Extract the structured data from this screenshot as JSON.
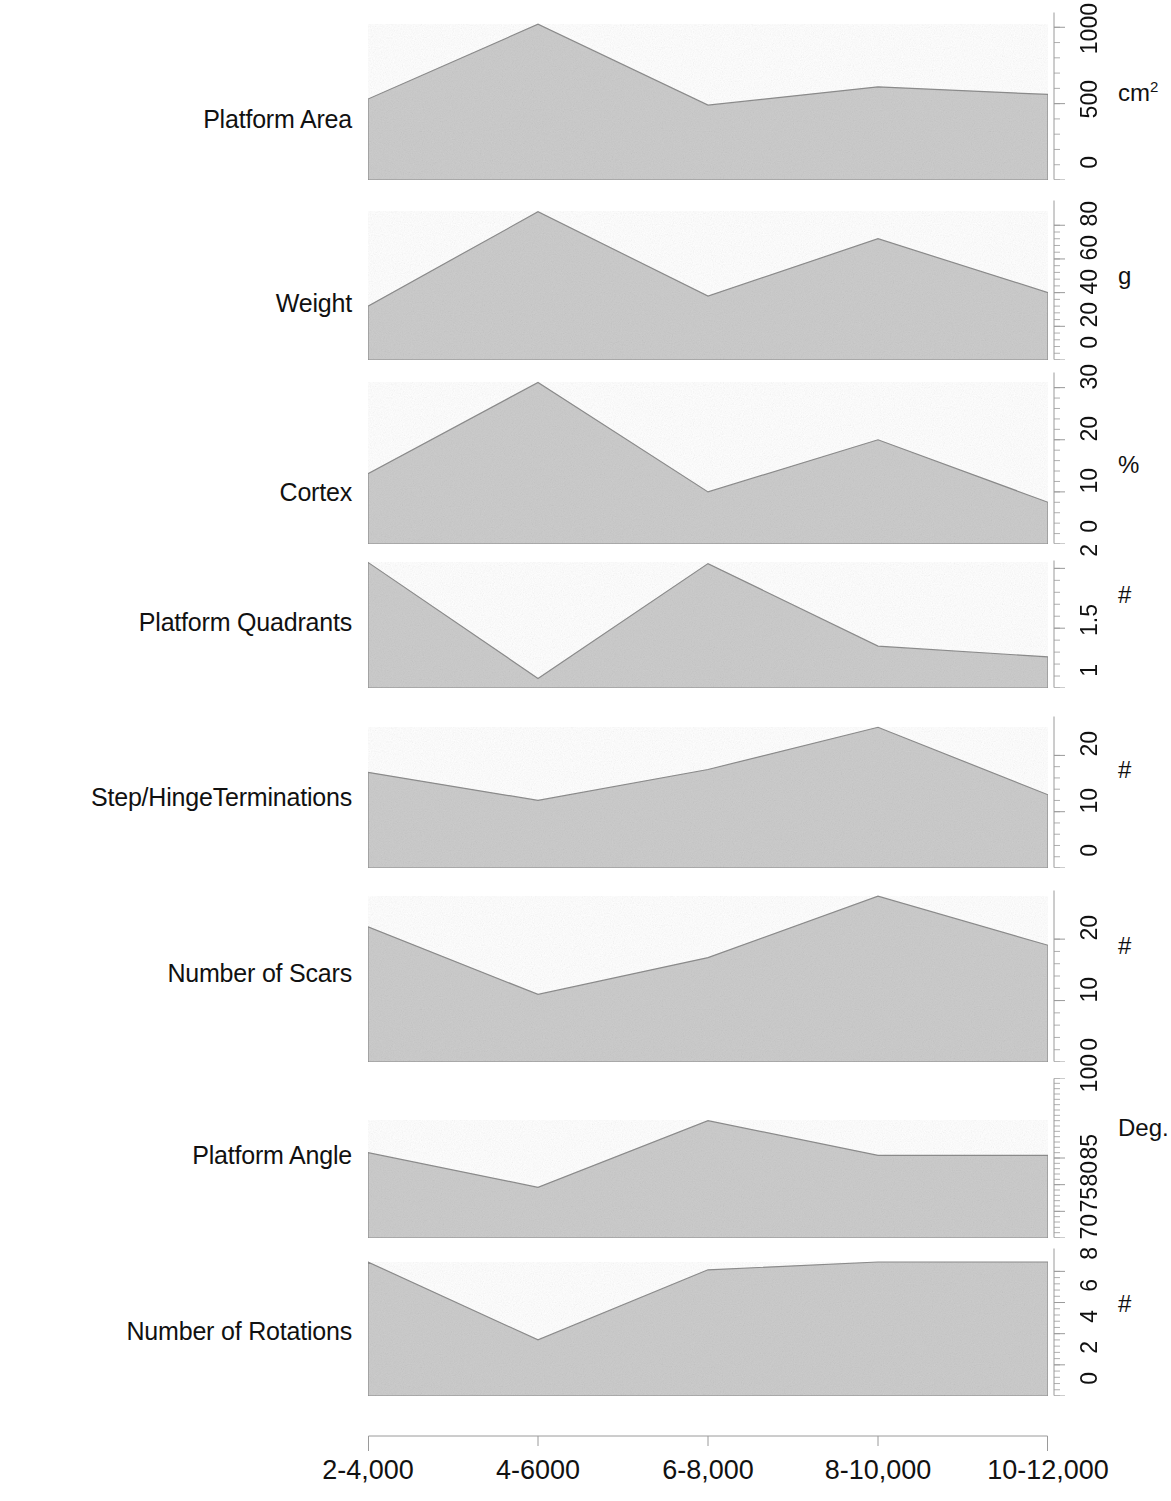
{
  "figure": {
    "background": "#ffffff",
    "series_fill": "#c9c9c9",
    "series_stroke": "#8a8a8a",
    "axis_color": "#9a9a9a",
    "text_color": "#111111"
  },
  "xaxis": {
    "categories": [
      "2-4,000",
      "4-6000",
      "6-8,000",
      "8-10,000",
      "10-12,000"
    ]
  },
  "panels": [
    {
      "label": "Platform Area",
      "unit": "cm",
      "unit_sup": "2",
      "ticks": [
        "0",
        "500",
        "1000"
      ],
      "tick_values": [
        0,
        500,
        1000
      ],
      "ylim": [
        0,
        1100
      ],
      "values": [
        530,
        1020,
        490,
        610,
        560
      ]
    },
    {
      "label": "Weight",
      "unit": "g",
      "unit_sup": "",
      "ticks": [
        "0",
        "20",
        "40",
        "60",
        "80"
      ],
      "tick_values": [
        0,
        20,
        40,
        60,
        80
      ],
      "ylim": [
        0,
        95
      ],
      "values": [
        32,
        88,
        38,
        72,
        40
      ]
    },
    {
      "label": "Cortex",
      "unit": "%",
      "unit_sup": "",
      "ticks": [
        "0",
        "10",
        "20",
        "30"
      ],
      "tick_values": [
        0,
        10,
        20,
        30
      ],
      "ylim": [
        0,
        33
      ],
      "values": [
        13.5,
        31,
        10,
        20,
        8
      ]
    },
    {
      "label": "Platform Quadrants",
      "unit": "#",
      "unit_sup": "",
      "ticks": [
        "1",
        "1.5",
        "2"
      ],
      "tick_values": [
        1,
        1.5,
        2
      ],
      "ylim": [
        1,
        2.07
      ],
      "values": [
        2.05,
        1.08,
        2.04,
        1.35,
        1.26
      ]
    },
    {
      "label": "Step/HingeTerminations",
      "unit": "#",
      "unit_sup": "",
      "ticks": [
        "0",
        "10",
        "20"
      ],
      "tick_values": [
        0,
        10,
        20
      ],
      "ylim": [
        0,
        27
      ],
      "values": [
        17,
        12,
        17.5,
        25,
        13
      ]
    },
    {
      "label": "Number of Scars",
      "unit": "#",
      "unit_sup": "",
      "ticks": [
        "0",
        "10",
        "20"
      ],
      "tick_values": [
        0,
        10,
        20
      ],
      "ylim": [
        0,
        28
      ],
      "values": [
        22,
        11,
        17,
        27,
        19
      ]
    },
    {
      "label": "Platform Angle",
      "unit": "Deg.",
      "unit_sup": "",
      "ticks": [
        "70",
        "75",
        "80",
        "85",
        "100"
      ],
      "tick_values": [
        70,
        75,
        80,
        85,
        100
      ],
      "ylim": [
        70,
        100
      ],
      "values": [
        86,
        79.5,
        92,
        85.5,
        85.5
      ]
    },
    {
      "label": "Number of Rotations",
      "unit": "#",
      "unit_sup": "",
      "ticks": [
        "0",
        "2",
        "4",
        "6",
        "8"
      ],
      "tick_values": [
        0,
        2,
        4,
        6,
        8
      ],
      "ylim": [
        0,
        9.5
      ],
      "values": [
        8.6,
        3.6,
        8.1,
        8.6,
        8.6
      ]
    }
  ],
  "chart_data": {
    "type": "area",
    "title": "",
    "xlabel": "",
    "ylabel": "",
    "grid": false,
    "legend": "none",
    "layout": "stacked small-multiple area panels, shared x-axis",
    "categories": [
      "2-4,000",
      "4-6000",
      "6-8,000",
      "8-10,000",
      "10-12,000"
    ],
    "series": [
      {
        "name": "Platform Area",
        "unit": "cm2",
        "ylim": [
          0,
          1100
        ],
        "yticks": [
          0,
          500,
          1000
        ],
        "values": [
          530,
          1020,
          490,
          610,
          560
        ]
      },
      {
        "name": "Weight",
        "unit": "g",
        "ylim": [
          0,
          95
        ],
        "yticks": [
          0,
          20,
          40,
          60,
          80
        ],
        "values": [
          32,
          88,
          38,
          72,
          40
        ]
      },
      {
        "name": "Cortex",
        "unit": "%",
        "ylim": [
          0,
          33
        ],
        "yticks": [
          0,
          10,
          20,
          30
        ],
        "values": [
          13.5,
          31,
          10,
          20,
          8
        ]
      },
      {
        "name": "Platform Quadrants",
        "unit": "#",
        "ylim": [
          1,
          2.07
        ],
        "yticks": [
          1,
          1.5,
          2
        ],
        "values": [
          2.05,
          1.08,
          2.04,
          1.35,
          1.26
        ]
      },
      {
        "name": "Step/HingeTerminations",
        "unit": "#",
        "ylim": [
          0,
          27
        ],
        "yticks": [
          0,
          10,
          20
        ],
        "values": [
          17,
          12,
          17.5,
          25,
          13
        ]
      },
      {
        "name": "Number of Scars",
        "unit": "#",
        "ylim": [
          0,
          28
        ],
        "yticks": [
          0,
          10,
          20
        ],
        "values": [
          22,
          11,
          17,
          27,
          19
        ]
      },
      {
        "name": "Platform Angle",
        "unit": "Deg.",
        "ylim": [
          70,
          100
        ],
        "yticks": [
          70,
          75,
          80,
          85,
          100
        ],
        "values": [
          86,
          79.5,
          92,
          85.5,
          85.5
        ]
      },
      {
        "name": "Number of Rotations",
        "unit": "#",
        "ylim": [
          0,
          9.5
        ],
        "yticks": [
          0,
          2,
          4,
          6,
          8
        ],
        "values": [
          8.6,
          3.6,
          8.1,
          8.6,
          8.6
        ]
      }
    ]
  }
}
